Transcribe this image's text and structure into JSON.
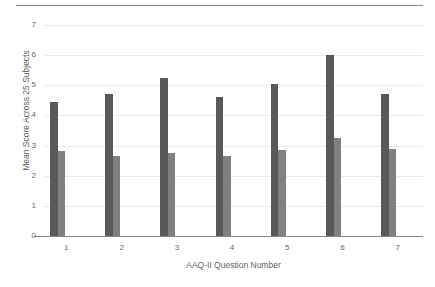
{
  "chart_data": {
    "type": "bar",
    "title": "",
    "xlabel": "AAQ-II Question Number",
    "ylabel": "Mean Score Across 25 Subjects",
    "categories": [
      "1",
      "2",
      "3",
      "4",
      "5",
      "6",
      "7"
    ],
    "ylim": [
      0,
      7
    ],
    "yticks": [
      0,
      1,
      2,
      3,
      4,
      5,
      6,
      7
    ],
    "ytick_labels": [
      "0",
      "1",
      "2",
      "3",
      "4",
      "5",
      "6",
      "7"
    ],
    "grid": true,
    "legend": "none",
    "series": [
      {
        "name": "series-1",
        "color": "#595959",
        "values": [
          4.45,
          4.7,
          5.25,
          4.6,
          5.05,
          6.0,
          4.72
        ]
      },
      {
        "name": "series-2",
        "color": "#808080",
        "values": [
          2.82,
          2.67,
          2.75,
          2.65,
          2.85,
          3.25,
          2.88
        ]
      }
    ]
  }
}
